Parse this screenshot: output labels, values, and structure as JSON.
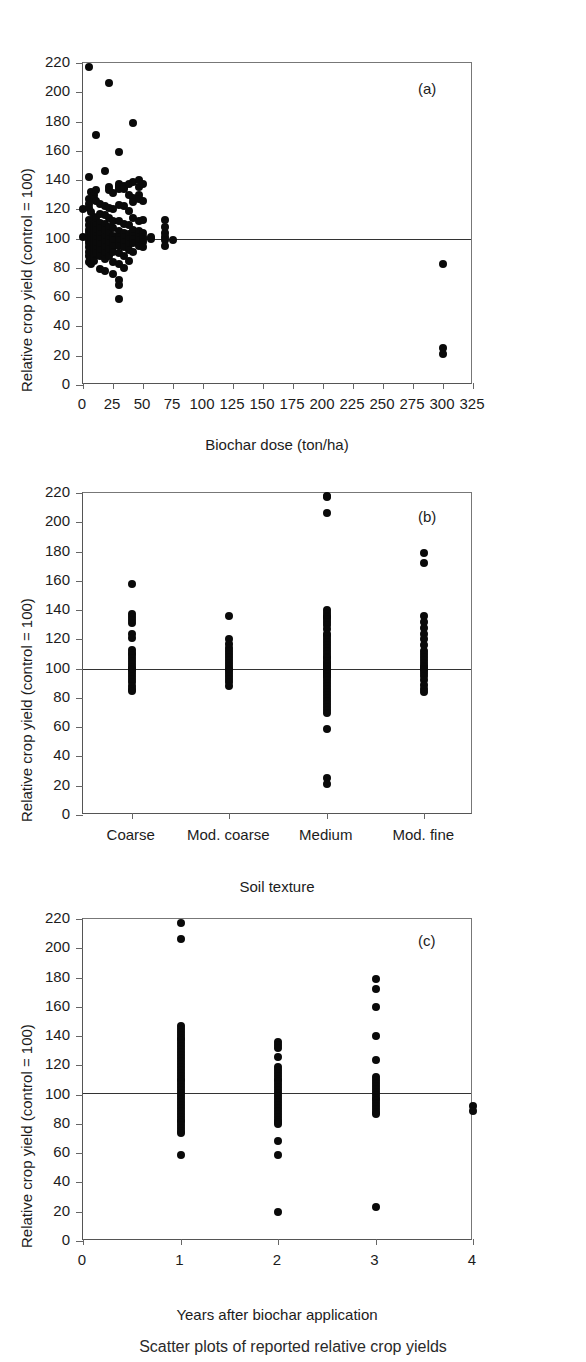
{
  "figure": {
    "background": "#ffffff",
    "dot_color": "#0a0a0a",
    "axis_color": "#555555",
    "refline_color": "#333333",
    "caption": "Scatter plots of reported relative crop yields"
  },
  "chart_data": [
    {
      "type": "scatter",
      "panel_tag": "(a)",
      "title": "",
      "xlabel": "Biochar dose (ton/ha)",
      "ylabel": "Relative crop yield (control = 100)",
      "xlim": [
        0,
        325
      ],
      "ylim": [
        0,
        220
      ],
      "xticks": [
        0,
        25,
        50,
        75,
        100,
        125,
        150,
        175,
        200,
        225,
        250,
        275,
        300,
        325
      ],
      "yticks": [
        0,
        20,
        40,
        60,
        80,
        100,
        120,
        140,
        160,
        180,
        200,
        220
      ],
      "grid": false,
      "reference_line_y": 100,
      "points": [
        [
          0,
          120
        ],
        [
          0,
          101
        ],
        [
          5,
          217
        ],
        [
          5,
          142
        ],
        [
          5,
          127
        ],
        [
          5,
          124
        ],
        [
          5,
          121
        ],
        [
          5,
          113
        ],
        [
          5,
          109
        ],
        [
          5,
          106
        ],
        [
          5,
          104
        ],
        [
          5,
          101
        ],
        [
          5,
          99
        ],
        [
          5,
          97
        ],
        [
          5,
          94
        ],
        [
          5,
          91
        ],
        [
          5,
          88
        ],
        [
          5,
          84
        ],
        [
          7,
          132
        ],
        [
          7,
          118
        ],
        [
          7,
          112
        ],
        [
          7,
          108
        ],
        [
          7,
          105
        ],
        [
          7,
          102
        ],
        [
          7,
          99
        ],
        [
          7,
          96
        ],
        [
          7,
          93
        ],
        [
          7,
          90
        ],
        [
          7,
          86
        ],
        [
          7,
          83
        ],
        [
          9,
          130
        ],
        [
          9,
          127
        ],
        [
          9,
          115
        ],
        [
          9,
          110
        ],
        [
          9,
          107
        ],
        [
          9,
          103
        ],
        [
          9,
          100
        ],
        [
          9,
          98
        ],
        [
          9,
          95
        ],
        [
          9,
          92
        ],
        [
          9,
          89
        ],
        [
          9,
          85
        ],
        [
          11,
          171
        ],
        [
          11,
          133
        ],
        [
          11,
          126
        ],
        [
          11,
          114
        ],
        [
          11,
          109
        ],
        [
          11,
          106
        ],
        [
          11,
          102
        ],
        [
          11,
          100
        ],
        [
          11,
          97
        ],
        [
          11,
          93
        ],
        [
          11,
          90
        ],
        [
          14,
          124
        ],
        [
          14,
          117
        ],
        [
          14,
          111
        ],
        [
          14,
          107
        ],
        [
          14,
          103
        ],
        [
          14,
          100
        ],
        [
          14,
          96
        ],
        [
          14,
          92
        ],
        [
          14,
          88
        ],
        [
          14,
          79
        ],
        [
          18,
          146
        ],
        [
          18,
          122
        ],
        [
          18,
          116
        ],
        [
          18,
          110
        ],
        [
          18,
          106
        ],
        [
          18,
          101
        ],
        [
          18,
          98
        ],
        [
          18,
          94
        ],
        [
          18,
          90
        ],
        [
          18,
          86
        ],
        [
          18,
          78
        ],
        [
          22,
          206
        ],
        [
          22,
          135
        ],
        [
          22,
          133
        ],
        [
          22,
          121
        ],
        [
          22,
          114
        ],
        [
          22,
          108
        ],
        [
          22,
          104
        ],
        [
          22,
          100
        ],
        [
          22,
          97
        ],
        [
          22,
          93
        ],
        [
          22,
          88
        ],
        [
          25,
          131
        ],
        [
          25,
          120
        ],
        [
          25,
          112
        ],
        [
          25,
          107
        ],
        [
          25,
          102
        ],
        [
          25,
          99
        ],
        [
          25,
          95
        ],
        [
          25,
          91
        ],
        [
          25,
          84
        ],
        [
          25,
          76
        ],
        [
          30,
          159
        ],
        [
          30,
          137
        ],
        [
          30,
          136
        ],
        [
          30,
          135
        ],
        [
          30,
          134
        ],
        [
          30,
          123
        ],
        [
          30,
          112
        ],
        [
          30,
          105
        ],
        [
          30,
          101
        ],
        [
          30,
          99
        ],
        [
          30,
          95
        ],
        [
          30,
          90
        ],
        [
          30,
          83
        ],
        [
          30,
          72
        ],
        [
          30,
          68
        ],
        [
          30,
          59
        ],
        [
          34,
          136
        ],
        [
          34,
          135
        ],
        [
          34,
          134
        ],
        [
          34,
          122
        ],
        [
          34,
          110
        ],
        [
          34,
          104
        ],
        [
          34,
          101
        ],
        [
          34,
          98
        ],
        [
          34,
          94
        ],
        [
          34,
          88
        ],
        [
          34,
          80
        ],
        [
          38,
          137
        ],
        [
          38,
          130
        ],
        [
          38,
          119
        ],
        [
          38,
          109
        ],
        [
          38,
          103
        ],
        [
          38,
          100
        ],
        [
          38,
          96
        ],
        [
          38,
          92
        ],
        [
          38,
          85
        ],
        [
          42,
          179
        ],
        [
          42,
          139
        ],
        [
          42,
          128
        ],
        [
          42,
          125
        ],
        [
          42,
          114
        ],
        [
          42,
          106
        ],
        [
          42,
          102
        ],
        [
          42,
          100
        ],
        [
          42,
          97
        ],
        [
          42,
          91
        ],
        [
          47,
          140
        ],
        [
          47,
          135
        ],
        [
          47,
          130
        ],
        [
          47,
          127
        ],
        [
          47,
          112
        ],
        [
          47,
          105
        ],
        [
          47,
          101
        ],
        [
          47,
          99
        ],
        [
          47,
          95
        ],
        [
          50,
          137
        ],
        [
          50,
          126
        ],
        [
          50,
          113
        ],
        [
          50,
          104
        ],
        [
          50,
          101
        ],
        [
          50,
          100
        ],
        [
          50,
          98
        ],
        [
          50,
          94
        ],
        [
          57,
          101
        ],
        [
          57,
          100
        ],
        [
          68,
          113
        ],
        [
          68,
          108
        ],
        [
          68,
          104
        ],
        [
          68,
          101
        ],
        [
          68,
          99
        ],
        [
          68,
          95
        ],
        [
          75,
          99
        ],
        [
          300,
          83
        ],
        [
          300,
          25
        ],
        [
          300,
          21
        ]
      ]
    },
    {
      "type": "scatter",
      "panel_tag": "(b)",
      "title": "",
      "xlabel": "Soil texture",
      "ylabel": "Relative crop yield (control = 100)",
      "categories": [
        "Coarse",
        "Mod. coarse",
        "Medium",
        "Mod. fine"
      ],
      "ylim": [
        0,
        220
      ],
      "yticks": [
        0,
        20,
        40,
        60,
        80,
        100,
        120,
        140,
        160,
        180,
        200,
        220
      ],
      "grid": false,
      "reference_line_y": 100,
      "series": [
        {
          "name": "Coarse",
          "values": [
            158,
            137,
            135,
            133,
            131,
            124,
            121,
            113,
            111,
            109,
            107,
            105,
            103,
            101,
            100,
            99,
            97,
            95,
            93,
            91,
            88,
            86,
            85
          ]
        },
        {
          "name": "Mod. coarse",
          "values": [
            136,
            120,
            117,
            114,
            112,
            110,
            108,
            106,
            104,
            102,
            100,
            99,
            97,
            95,
            93,
            91,
            88
          ]
        },
        {
          "name": "Medium",
          "values": [
            218,
            217,
            206,
            140,
            138,
            136,
            135,
            134,
            132,
            130,
            127,
            124,
            122,
            120,
            118,
            116,
            114,
            112,
            110,
            108,
            107,
            105,
            104,
            103,
            102,
            101,
            100,
            99,
            98,
            97,
            96,
            95,
            94,
            92,
            90,
            88,
            86,
            84,
            82,
            80,
            78,
            76,
            74,
            72,
            70,
            59,
            25,
            21
          ]
        },
        {
          "name": "Mod. fine",
          "values": [
            179,
            172,
            136,
            132,
            128,
            124,
            120,
            116,
            112,
            110,
            108,
            106,
            104,
            102,
            101,
            100,
            99,
            97,
            95,
            92,
            89,
            86,
            84
          ]
        }
      ]
    },
    {
      "type": "scatter",
      "panel_tag": "(c)",
      "title": "",
      "xlabel": "Years after biochar application",
      "ylabel": "Relative crop yield (control = 100)",
      "xlim": [
        0,
        4
      ],
      "ylim": [
        0,
        220
      ],
      "xticks": [
        0,
        1,
        2,
        3,
        4
      ],
      "yticks": [
        0,
        20,
        40,
        60,
        80,
        100,
        120,
        140,
        160,
        180,
        200,
        220
      ],
      "grid": false,
      "reference_line_y": 101,
      "series": [
        {
          "name": "1",
          "values": [
            217,
            206,
            147,
            145,
            143,
            141,
            139,
            137,
            135,
            133,
            131,
            129,
            127,
            125,
            123,
            121,
            119,
            117,
            115,
            113,
            111,
            109,
            107,
            105,
            103,
            101,
            99,
            97,
            95,
            93,
            91,
            89,
            87,
            85,
            83,
            81,
            79,
            77,
            75,
            74,
            59
          ]
        },
        {
          "name": "2",
          "values": [
            136,
            134,
            132,
            126,
            119,
            117,
            115,
            113,
            111,
            109,
            107,
            105,
            103,
            101,
            99,
            97,
            95,
            93,
            91,
            89,
            87,
            85,
            83,
            81,
            80,
            68,
            59,
            20
          ]
        },
        {
          "name": "3",
          "values": [
            179,
            172,
            160,
            140,
            124,
            112,
            110,
            108,
            106,
            104,
            102,
            100,
            98,
            96,
            94,
            92,
            90,
            88,
            87,
            23
          ]
        },
        {
          "name": "4",
          "values": [
            92,
            89
          ]
        }
      ]
    }
  ]
}
